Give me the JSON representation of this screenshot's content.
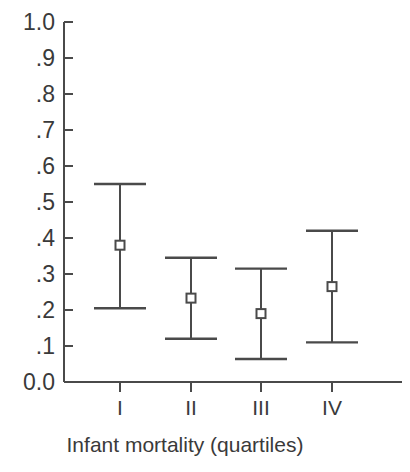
{
  "chart_data": {
    "type": "scatter",
    "title": "",
    "subtitle": "",
    "xlabel": "Infant mortality (quartiles)",
    "ylabel": "",
    "categories": [
      "I",
      "II",
      "III",
      "IV"
    ],
    "ylim": [
      0.0,
      1.0
    ],
    "xlim": [
      0,
      4.8
    ],
    "grid": false,
    "legend": null,
    "legend_position": "none",
    "y_tick_labels": [
      "1.0",
      ".9",
      ".8",
      ".7",
      ".6",
      ".5",
      ".4",
      ".3",
      ".2",
      ".1",
      "0.0"
    ],
    "y_tick_values": [
      1.0,
      0.9,
      0.8,
      0.7,
      0.6,
      0.5,
      0.4,
      0.3,
      0.2,
      0.1,
      0.0
    ],
    "x_tick_labels": [
      "I",
      "II",
      "III",
      "IV"
    ],
    "series": [
      {
        "name": "estimate",
        "marker": "open-square",
        "values": [
          0.38,
          0.233,
          0.19,
          0.265
        ],
        "error_low": [
          0.205,
          0.12,
          0.064,
          0.11
        ],
        "error_high": [
          0.55,
          0.345,
          0.315,
          0.42
        ]
      }
    ],
    "points": [
      {
        "category": "I",
        "value": 0.38,
        "ci_low": 0.205,
        "ci_high": 0.55
      },
      {
        "category": "II",
        "value": 0.233,
        "ci_low": 0.12,
        "ci_high": 0.345
      },
      {
        "category": "III",
        "value": 0.19,
        "ci_low": 0.064,
        "ci_high": 0.315
      },
      {
        "category": "IV",
        "value": 0.265,
        "ci_low": 0.11,
        "ci_high": 0.42
      }
    ],
    "colors": {
      "axis": "#4a4a4a",
      "marker_stroke": "#4a4a4a",
      "marker_fill": "#ffffff",
      "text": "#3a3a3a",
      "background": "#ffffff"
    }
  }
}
